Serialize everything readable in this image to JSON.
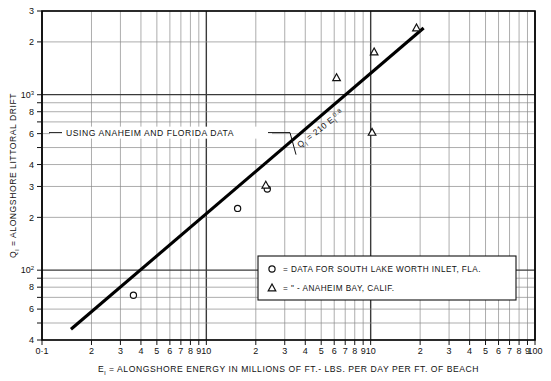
{
  "chart_data": {
    "type": "scatter",
    "title": "",
    "xlabel": "Eₗ = ALONGSHORE ENERGY IN MILLIONS OF FT.- LBS. PER DAY PER FT. OF BEACH",
    "ylabel": "Qₗ = ALONGSHORE LITTORAL DRIFT",
    "xscale": "log",
    "yscale": "log",
    "xlim": [
      0.1,
      100
    ],
    "ylim": [
      40,
      3000
    ],
    "grid": true,
    "legend_position": "lower-right",
    "x_tick_labels": [
      "0·1",
      "2",
      "3",
      "4",
      "5",
      "6",
      "7",
      "8",
      "9",
      "10",
      "2",
      "3",
      "4",
      "5",
      "6",
      "7",
      "8",
      "9",
      "10",
      "2",
      "3",
      "4",
      "5",
      "6",
      "7",
      "8",
      "9",
      "100"
    ],
    "y_tick_labels": [
      "4",
      "6",
      "8",
      "10²",
      "2",
      "3",
      "4",
      "6",
      "8",
      "10³",
      "2",
      "3"
    ],
    "y_tick_values": [
      40,
      60,
      80,
      100,
      200,
      300,
      400,
      600,
      800,
      1000,
      2000,
      3000
    ],
    "fit_line": {
      "label": "Qₗ = 210 Eₗ",
      "label_exponent": "0.8",
      "coefficient": 210,
      "exponent": 0.8,
      "x_from": 0.15,
      "x_to": 21.0
    },
    "annotations": [
      {
        "name": "using-data-note",
        "text": "USING ANAHEIM AND FLORIDA DATA"
      }
    ],
    "series": [
      {
        "name": "DATA FOR SOUTH LAKE WORTH INLET, FLA.",
        "marker": "circle",
        "points": [
          {
            "x": 0.36,
            "y": 72
          },
          {
            "x": 1.55,
            "y": 225
          },
          {
            "x": 2.35,
            "y": 290
          }
        ]
      },
      {
        "name": "ANAHEIM BAY, CALIF.",
        "marker": "triangle",
        "points": [
          {
            "x": 2.3,
            "y": 305
          },
          {
            "x": 6.2,
            "y": 1250
          },
          {
            "x": 10.5,
            "y": 1750
          },
          {
            "x": 19.0,
            "y": 2400
          },
          {
            "x": 10.2,
            "y": 610
          }
        ]
      }
    ],
    "legend": [
      {
        "marker": "circle",
        "eq": "=",
        "text": "DATA FOR SOUTH LAKE WORTH INLET, FLA."
      },
      {
        "marker": "triangle",
        "eq": "=",
        "text": "ANAHEIM BAY, CALIF.",
        "ditto_left": "\"",
        "ditto_right": "-"
      }
    ],
    "colors": {
      "line": "#000000",
      "grid_major": "#3a3a3a",
      "grid_minor": "#8a8a8a",
      "frame": "#000000",
      "background": "#ffffff"
    }
  },
  "axis": {
    "x_caption_pre": "E",
    "x_caption_sub": "l",
    "x_caption_post": " = ALONGSHORE ENERGY IN MILLIONS OF FT.- LBS. PER DAY PER FT. OF BEACH",
    "y_caption_pre": "Q",
    "y_caption_sub": "l",
    "y_caption_post": " = ALONGSHORE LITTORAL DRIFT"
  }
}
